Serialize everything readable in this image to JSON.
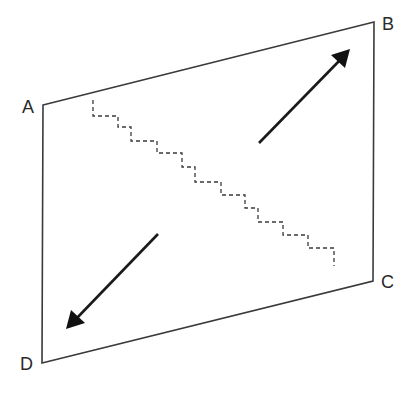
{
  "diagram": {
    "type": "parallelogram-with-arrows",
    "corners": [
      {
        "id": "A",
        "label": "A",
        "x": 43,
        "y": 105
      },
      {
        "id": "B",
        "label": "B",
        "x": 374,
        "y": 22
      },
      {
        "id": "C",
        "label": "C",
        "x": 373,
        "y": 281
      },
      {
        "id": "D",
        "label": "D",
        "x": 42,
        "y": 363
      }
    ],
    "arrows": [
      {
        "name": "arrow-toward-B",
        "from": [
          259,
          143
        ],
        "to": [
          349,
          50
        ]
      },
      {
        "name": "arrow-toward-D",
        "from": [
          158,
          234
        ],
        "to": [
          67,
          328
        ]
      }
    ],
    "stair_path": {
      "style": "dashed",
      "description": "Dashed stair-step line running diagonally from near A toward C"
    },
    "colors": {
      "line": "#3a3a3a",
      "arrow": "#1a1a1a",
      "background": "#ffffff"
    }
  }
}
